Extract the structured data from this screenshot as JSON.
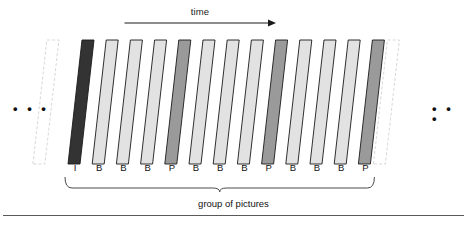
{
  "figure": {
    "time_axis": {
      "label": "time",
      "arrow_direction": "right",
      "arrow_x_start": 124,
      "arrow_x_end": 276
    },
    "caption": "group of pictures",
    "ellipsis_left": "• • •",
    "ellipsis_right": "• • •",
    "colors": {
      "i_frame": "#333333",
      "b_frame": "#e2e2e2",
      "p_frame": "#9a9a9a",
      "ghost_frame": "#ffffff",
      "frame_outline": "#1a1a1a",
      "ghost_outline": "#d8d8d8",
      "rule": "#5a5a5a",
      "text": "#111111"
    },
    "frames": [
      {
        "label": "I",
        "type": "i_frame"
      },
      {
        "label": "B",
        "type": "b_frame"
      },
      {
        "label": "B",
        "type": "b_frame"
      },
      {
        "label": "B",
        "type": "b_frame"
      },
      {
        "label": "P",
        "type": "p_frame"
      },
      {
        "label": "B",
        "type": "b_frame"
      },
      {
        "label": "B",
        "type": "b_frame"
      },
      {
        "label": "B",
        "type": "b_frame"
      },
      {
        "label": "P",
        "type": "p_frame"
      },
      {
        "label": "B",
        "type": "b_frame"
      },
      {
        "label": "B",
        "type": "b_frame"
      },
      {
        "label": "B",
        "type": "b_frame"
      },
      {
        "label": "P",
        "type": "p_frame"
      }
    ]
  }
}
